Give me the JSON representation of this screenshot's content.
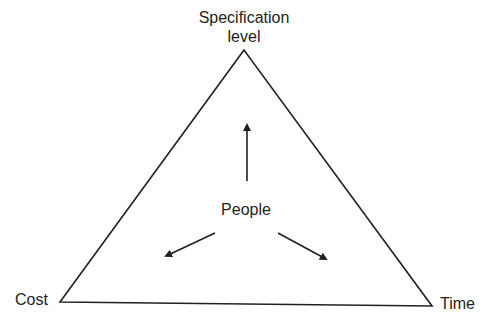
{
  "diagram": {
    "vertices": {
      "top": {
        "label_line1": "Specification",
        "label_line2": "level",
        "x": 244,
        "y": 50
      },
      "bottom_left": {
        "label": "Cost",
        "x": 60,
        "y": 302
      },
      "bottom_right": {
        "label": "Time",
        "x": 432,
        "y": 306
      }
    },
    "center": {
      "label": "People"
    },
    "arrows": [
      {
        "name": "people-to-specification",
        "from": [
          247,
          181
        ],
        "to": [
          247,
          123
        ]
      },
      {
        "name": "people-to-cost",
        "from": [
          215,
          233
        ],
        "to": [
          164,
          257
        ]
      },
      {
        "name": "people-to-time",
        "from": [
          278,
          233
        ],
        "to": [
          328,
          260
        ]
      }
    ],
    "colors": {
      "stroke": "#231f20",
      "text": "#231f20",
      "background": "#ffffff"
    }
  }
}
